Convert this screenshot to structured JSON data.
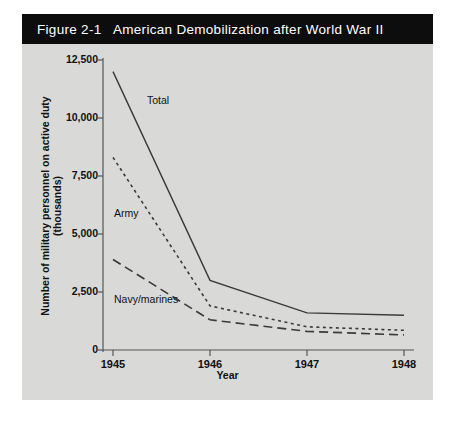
{
  "figure": {
    "number": "Figure 2-1",
    "title": "American Demobilization after World War II",
    "title_full": "Figure 2-1   American Demobilization after World War II"
  },
  "colors": {
    "title_bar_background": "#0d0d0d",
    "title_bar_text": "#ffffff",
    "panel_background": "#d9d9d7",
    "axis": "#555555",
    "line": "#3a3a3a",
    "page_background": "#ffffff"
  },
  "chart_data": {
    "type": "line",
    "title": "American Demobilization after World War II",
    "xlabel": "Year",
    "ylabel": "Number of military personnel on active duty (thousands)",
    "x": [
      "1945",
      "1946",
      "1947",
      "1948"
    ],
    "xticklabels": [
      "1945",
      "1946",
      "1947",
      "1948"
    ],
    "yticklabels": [
      "0",
      "2,500",
      "5,000",
      "7,500",
      "10,000",
      "12,500"
    ],
    "ytickvalues": [
      0,
      2500,
      5000,
      7500,
      10000,
      12500
    ],
    "ylim": [
      0,
      12500
    ],
    "grid": false,
    "legend": "inline-labels",
    "series": [
      {
        "name": "Total",
        "style": "solid",
        "values": [
          12000,
          3000,
          1600,
          1500
        ],
        "label": "Total"
      },
      {
        "name": "Army",
        "style": "dotted",
        "values": [
          8300,
          1900,
          1000,
          850
        ],
        "label": "Army"
      },
      {
        "name": "Navy/marines",
        "style": "dashed",
        "values": [
          3900,
          1300,
          800,
          650
        ],
        "label": "Navy/marines"
      }
    ]
  }
}
